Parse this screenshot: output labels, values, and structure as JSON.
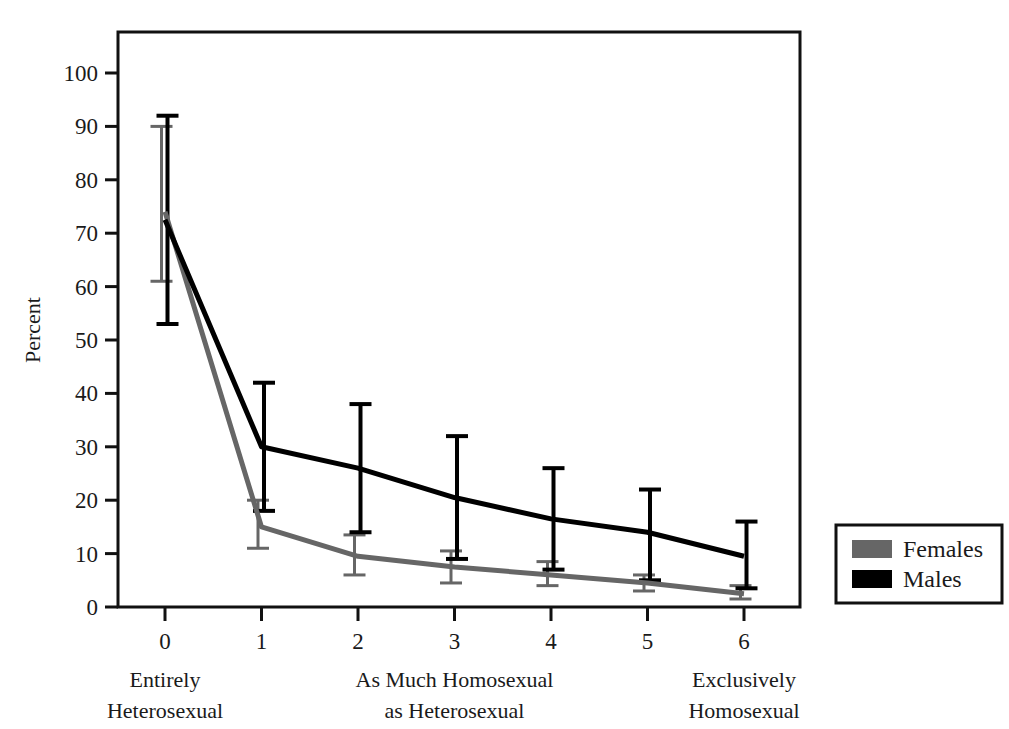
{
  "chart_data": {
    "type": "line",
    "title": "",
    "xlabel": "",
    "ylabel": "Percent",
    "xlim": [
      -0.45,
      6.6
    ],
    "ylim": [
      0,
      107
    ],
    "ytick_values": [
      0,
      10,
      20,
      30,
      40,
      50,
      60,
      70,
      80,
      90,
      100
    ],
    "ytick_labels": [
      "0",
      "10",
      "20",
      "30",
      "40",
      "50",
      "60",
      "70",
      "80",
      "90",
      "100"
    ],
    "xtick_values": [
      0,
      1,
      2,
      3,
      4,
      5,
      6
    ],
    "xtick_labels": [
      "0",
      "1",
      "2",
      "3",
      "4",
      "5",
      "6"
    ],
    "x_group_labels": [
      {
        "at": 0,
        "line1": "Entirely",
        "line2": "Heterosexual"
      },
      {
        "at": 3,
        "line1": "As Much Homosexual",
        "line2": "as Heterosexual"
      },
      {
        "at": 6,
        "line1": "Exclusively",
        "line2": "Homosexual"
      }
    ],
    "grid": false,
    "legend_position": "right-outside",
    "error_bars": true,
    "series": [
      {
        "name": "Females",
        "color": "#666666",
        "x": [
          0,
          1,
          2,
          3,
          4,
          5,
          6
        ],
        "values": [
          74.0,
          15.0,
          9.5,
          7.5,
          6.0,
          4.5,
          2.5
        ],
        "err_low": [
          61.0,
          11.0,
          6.0,
          4.5,
          4.0,
          3.0,
          1.5
        ],
        "err_high": [
          90.0,
          20.0,
          13.5,
          10.5,
          8.5,
          6.0,
          4.0
        ]
      },
      {
        "name": "Males",
        "color": "#000000",
        "x": [
          0,
          1,
          2,
          3,
          4,
          5,
          6
        ],
        "values": [
          72.5,
          30.0,
          26.0,
          20.5,
          16.5,
          14.0,
          9.5
        ],
        "err_low": [
          53.0,
          18.0,
          14.0,
          9.0,
          7.0,
          5.0,
          3.5
        ],
        "err_high": [
          92.0,
          42.0,
          38.0,
          32.0,
          26.0,
          22.0,
          16.0
        ]
      }
    ]
  },
  "legend": {
    "entries": [
      {
        "label": "Females",
        "color": "#666666"
      },
      {
        "label": "Males",
        "color": "#000000"
      }
    ]
  },
  "axes": {
    "y_title": "Percent"
  }
}
